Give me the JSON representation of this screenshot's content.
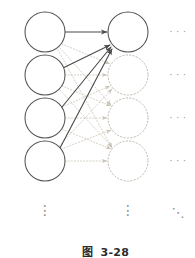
{
  "figure": {
    "caption_label": "图",
    "caption_number": "3-28",
    "caption_full": "图  3-28",
    "background_color": "#ffffff"
  },
  "colors": {
    "node_solid_stroke": "#545454",
    "node_dotted_stroke": "#bdb9ad",
    "edge_solid": "#4a4a4a",
    "edge_dotted": "#cac5b8",
    "ellipsis": "#8a8a8a",
    "caption_text": "#2b2b2b"
  },
  "geometry": {
    "width": 195,
    "height": 258,
    "node_radius": 20,
    "left_column_x": 45,
    "right_column_x": 128,
    "row_y": [
      32,
      75,
      118,
      161
    ]
  },
  "layers": [
    {
      "name": "input-layer",
      "side": "left",
      "nodes": [
        {
          "id": "input-node-1",
          "cx": 45,
          "cy": 32,
          "r": 20,
          "style": "solid"
        },
        {
          "id": "input-node-2",
          "cx": 45,
          "cy": 75,
          "r": 20,
          "style": "solid"
        },
        {
          "id": "input-node-3",
          "cx": 45,
          "cy": 118,
          "r": 20,
          "style": "solid"
        },
        {
          "id": "input-node-4",
          "cx": 45,
          "cy": 161,
          "r": 20,
          "style": "solid"
        }
      ]
    },
    {
      "name": "output-layer",
      "side": "right",
      "nodes": [
        {
          "id": "output-node-1",
          "cx": 128,
          "cy": 32,
          "r": 20,
          "style": "solid"
        },
        {
          "id": "output-node-2",
          "cx": 128,
          "cy": 75,
          "r": 20,
          "style": "dotted"
        },
        {
          "id": "output-node-3",
          "cx": 128,
          "cy": 118,
          "r": 20,
          "style": "dotted"
        },
        {
          "id": "output-node-4",
          "cx": 128,
          "cy": 161,
          "r": 20,
          "style": "dotted"
        }
      ]
    }
  ],
  "edges_highlighted": [
    {
      "id": "edge-in1-out1",
      "from": "input-node-1",
      "to": "output-node-1",
      "x1": 65,
      "y1": 32,
      "x2": 107,
      "y2": 32,
      "style": "solid",
      "arrow": true
    },
    {
      "id": "edge-in2-out1",
      "from": "input-node-2",
      "to": "output-node-1",
      "x1": 63,
      "y1": 68,
      "x2": 110,
      "y2": 45,
      "style": "solid",
      "arrow": true
    },
    {
      "id": "edge-in3-out1",
      "from": "input-node-3",
      "to": "output-node-1",
      "x1": 62,
      "y1": 107,
      "x2": 111,
      "y2": 47,
      "style": "solid",
      "arrow": true
    },
    {
      "id": "edge-in4-out1",
      "from": "input-node-4",
      "to": "output-node-1",
      "x1": 60,
      "y1": 148,
      "x2": 112,
      "y2": 49,
      "style": "solid",
      "arrow": true
    }
  ],
  "edges_faded": [
    {
      "id": "edge-in1-out2",
      "x1": 62,
      "y1": 44,
      "x2": 110,
      "y2": 64
    },
    {
      "id": "edge-in1-out3",
      "x1": 60,
      "y1": 48,
      "x2": 111,
      "y2": 105
    },
    {
      "id": "edge-in1-out4",
      "x1": 58,
      "y1": 50,
      "x2": 112,
      "y2": 148
    },
    {
      "id": "edge-in2-out2",
      "x1": 65,
      "y1": 75,
      "x2": 107,
      "y2": 75
    },
    {
      "id": "edge-in2-out3",
      "x1": 62,
      "y1": 86,
      "x2": 111,
      "y2": 106
    },
    {
      "id": "edge-in2-out4",
      "x1": 60,
      "y1": 90,
      "x2": 112,
      "y2": 147
    },
    {
      "id": "edge-in3-out2",
      "x1": 62,
      "y1": 107,
      "x2": 110,
      "y2": 86
    },
    {
      "id": "edge-in3-out3",
      "x1": 65,
      "y1": 118,
      "x2": 107,
      "y2": 118
    },
    {
      "id": "edge-in3-out4",
      "x1": 62,
      "y1": 129,
      "x2": 111,
      "y2": 149
    },
    {
      "id": "edge-in4-out2",
      "x1": 59,
      "y1": 146,
      "x2": 112,
      "y2": 89
    },
    {
      "id": "edge-in4-out3",
      "x1": 61,
      "y1": 149,
      "x2": 111,
      "y2": 130
    },
    {
      "id": "edge-in4-out4",
      "x1": 65,
      "y1": 161,
      "x2": 107,
      "y2": 161
    }
  ],
  "ellipses_horizontal": [
    {
      "id": "row-ellipsis-1",
      "glyph": "· · ·",
      "x": 178,
      "y": 32
    },
    {
      "id": "row-ellipsis-2",
      "glyph": "· · ·",
      "x": 178,
      "y": 75
    },
    {
      "id": "row-ellipsis-3",
      "glyph": "· · ·",
      "x": 178,
      "y": 118
    },
    {
      "id": "row-ellipsis-4",
      "glyph": "· · ·",
      "x": 178,
      "y": 161
    }
  ],
  "ellipses_vertical": [
    {
      "id": "left-column-ellipsis",
      "glyph": "⋮",
      "x": 45,
      "y": 210
    },
    {
      "id": "right-column-ellipsis",
      "glyph": "⋮",
      "x": 128,
      "y": 210
    }
  ],
  "ellipsis_diagonal": {
    "id": "corner-ellipsis",
    "glyph": "⋱",
    "x": 178,
    "y": 212
  }
}
